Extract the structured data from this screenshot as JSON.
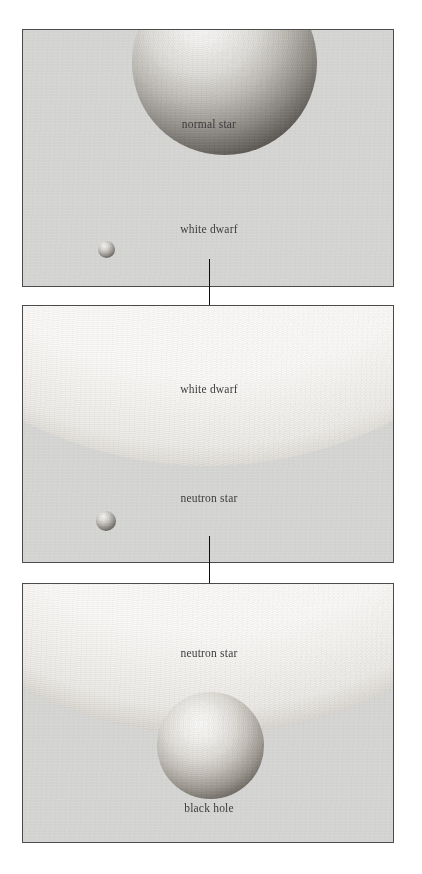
{
  "figure": {
    "background_color": "#ffffff",
    "panel_fill_color": "#d5d5d4",
    "panel_border_color": "#4a4a4a",
    "label_color": "#3a3a3a",
    "arrow_color": "#0d0d0d"
  },
  "panels": [
    {
      "index": 1,
      "objects": [
        {
          "name": "normal star",
          "label": "normal star",
          "role": "large-sphere-cropped-top",
          "relative_size": "largest"
        },
        {
          "name": "white dwarf",
          "label": "white dwarf",
          "role": "small-sphere",
          "relative_size": "tiny"
        }
      ]
    },
    {
      "index": 2,
      "objects": [
        {
          "name": "white dwarf",
          "label": "white dwarf",
          "role": "large-sphere-cropped-top",
          "relative_size": "largest"
        },
        {
          "name": "neutron star",
          "label": "neutron star",
          "role": "small-sphere",
          "relative_size": "tiny"
        }
      ]
    },
    {
      "index": 3,
      "objects": [
        {
          "name": "neutron star",
          "label": "neutron star",
          "role": "large-sphere-cropped-top",
          "relative_size": "largest"
        },
        {
          "name": "black hole",
          "label": "black hole",
          "role": "medium-sphere",
          "relative_size": "medium"
        }
      ]
    }
  ],
  "arrows": [
    {
      "from": "white dwarf (panel 1)",
      "to": "white dwarf (panel 2)",
      "direction": "down"
    },
    {
      "from": "neutron star (panel 2)",
      "to": "neutron star (panel 3)",
      "direction": "down"
    }
  ]
}
